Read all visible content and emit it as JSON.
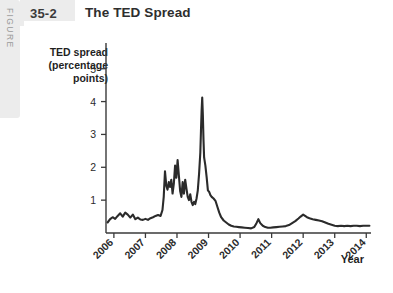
{
  "figure": {
    "side_label": "FIGURE",
    "number": "35-2",
    "title": "The TED Spread"
  },
  "chart_data": {
    "type": "line",
    "title": "The TED Spread",
    "xlabel": "Year",
    "ylabel": "TED spread (percentage points)",
    "ylabel_lines": [
      "TED spread",
      "(percentage",
      "points)"
    ],
    "xlim": [
      2005.75,
      2014.15
    ],
    "ylim": [
      0,
      5.6
    ],
    "grid": false,
    "legend": null,
    "ytick_labels": [
      "1",
      "2",
      "3",
      "4",
      "5"
    ],
    "yticks": [
      1,
      2,
      3,
      4,
      5
    ],
    "xtick_labels": [
      "2006",
      "2007",
      "2008",
      "2009",
      "2010",
      "2011",
      "2012",
      "2013",
      "2014"
    ],
    "xticks": [
      2006,
      2007,
      2008,
      2009,
      2010,
      2011,
      2012,
      2013,
      2014
    ],
    "series": [
      {
        "name": "TED spread",
        "color": "#2b2b2b",
        "x": [
          2005.8,
          2005.88,
          2005.96,
          2006.04,
          2006.12,
          2006.2,
          2006.28,
          2006.36,
          2006.44,
          2006.52,
          2006.6,
          2006.68,
          2006.76,
          2006.84,
          2006.92,
          2007.0,
          2007.08,
          2007.16,
          2007.24,
          2007.32,
          2007.4,
          2007.48,
          2007.54,
          2007.58,
          2007.62,
          2007.66,
          2007.7,
          2007.74,
          2007.78,
          2007.82,
          2007.86,
          2007.9,
          2007.94,
          2007.98,
          2008.02,
          2008.06,
          2008.1,
          2008.14,
          2008.18,
          2008.22,
          2008.26,
          2008.3,
          2008.34,
          2008.38,
          2008.42,
          2008.46,
          2008.5,
          2008.54,
          2008.58,
          2008.62,
          2008.66,
          2008.7,
          2008.74,
          2008.76,
          2008.78,
          2008.8,
          2008.82,
          2008.84,
          2008.86,
          2008.9,
          2008.94,
          2008.98,
          2009.02,
          2009.06,
          2009.1,
          2009.16,
          2009.22,
          2009.28,
          2009.34,
          2009.4,
          2009.48,
          2009.56,
          2009.64,
          2009.72,
          2009.8,
          2009.88,
          2009.96,
          2010.05,
          2010.15,
          2010.25,
          2010.35,
          2010.45,
          2010.52,
          2010.58,
          2010.64,
          2010.72,
          2010.8,
          2010.88,
          2010.96,
          2011.05,
          2011.15,
          2011.25,
          2011.35,
          2011.45,
          2011.55,
          2011.65,
          2011.75,
          2011.85,
          2011.92,
          2012.0,
          2012.06,
          2012.12,
          2012.2,
          2012.3,
          2012.4,
          2012.5,
          2012.6,
          2012.7,
          2012.8,
          2012.9,
          2013.0,
          2013.1,
          2013.2,
          2013.3,
          2013.4,
          2013.5,
          2013.6,
          2013.7,
          2013.8,
          2013.9,
          2014.0,
          2014.1
        ],
        "y": [
          0.32,
          0.42,
          0.48,
          0.43,
          0.52,
          0.6,
          0.5,
          0.62,
          0.56,
          0.47,
          0.56,
          0.42,
          0.47,
          0.41,
          0.4,
          0.43,
          0.4,
          0.45,
          0.48,
          0.52,
          0.55,
          0.52,
          0.7,
          1.1,
          1.88,
          1.45,
          1.32,
          1.55,
          1.4,
          1.62,
          1.2,
          1.5,
          2.05,
          1.68,
          2.22,
          1.75,
          1.28,
          1.1,
          1.55,
          1.2,
          1.62,
          1.35,
          1.1,
          1.0,
          1.18,
          0.95,
          0.85,
          0.95,
          0.88,
          1.05,
          1.3,
          1.8,
          2.45,
          3.1,
          3.7,
          4.12,
          3.6,
          2.85,
          2.3,
          2.05,
          1.7,
          1.3,
          1.25,
          1.15,
          1.1,
          1.05,
          0.98,
          0.8,
          0.62,
          0.48,
          0.38,
          0.32,
          0.26,
          0.22,
          0.2,
          0.19,
          0.18,
          0.17,
          0.16,
          0.15,
          0.14,
          0.18,
          0.3,
          0.42,
          0.3,
          0.22,
          0.18,
          0.16,
          0.16,
          0.17,
          0.18,
          0.19,
          0.2,
          0.21,
          0.24,
          0.3,
          0.36,
          0.44,
          0.5,
          0.56,
          0.52,
          0.48,
          0.45,
          0.42,
          0.4,
          0.38,
          0.36,
          0.32,
          0.28,
          0.25,
          0.22,
          0.21,
          0.22,
          0.21,
          0.22,
          0.21,
          0.22,
          0.22,
          0.21,
          0.22,
          0.22,
          0.22
        ]
      }
    ],
    "annotations": {
      "peak_value": 4.12,
      "peak_year": 2008.8
    }
  }
}
